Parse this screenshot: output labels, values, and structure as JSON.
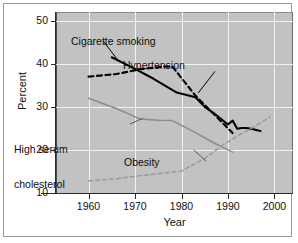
{
  "chart_data": {
    "type": "line",
    "title": "",
    "xlabel": "Year",
    "ylabel": "Percent",
    "xlim": [
      1953,
      2004
    ],
    "ylim": [
      10,
      52
    ],
    "xticks": [
      "1960",
      "1970",
      "1980",
      "1990",
      "2000"
    ],
    "xtick_values": [
      1960,
      1970,
      1980,
      1990,
      2000
    ],
    "yticks": [
      "10",
      "20",
      "30",
      "40",
      "50"
    ],
    "ytick_values": [
      10,
      20,
      30,
      40,
      50
    ],
    "grid": "white gridlines at ticks",
    "legend_position": "inline annotations with leader lines",
    "plot_background": "#c2c2c2",
    "series": [
      {
        "name": "Cigarette smoking",
        "color": "#000000",
        "style": "solid",
        "label_position": {
          "x": 1963.5,
          "y": 46.5
        },
        "x": [
          1965,
          1970,
          1974,
          1979,
          1983,
          1985,
          1987,
          1990,
          1991,
          1992,
          1993,
          1994,
          1995,
          1997
        ],
        "values": [
          41.5,
          38.8,
          36.5,
          33.3,
          32.2,
          30.0,
          28.5,
          25.9,
          26.8,
          24.9,
          25.1,
          25.1,
          24.9,
          24.4
        ]
      },
      {
        "name": "Hypertension",
        "color": "#000000",
        "style": "dashed",
        "label_position": {
          "x": 1988,
          "y": 39.2
        },
        "x": [
          1960,
          1966,
          1971,
          1976,
          1978,
          1983,
          1987,
          1991
        ],
        "values": [
          37.0,
          37.6,
          38.7,
          39.3,
          39.4,
          32.6,
          28.3,
          23.9
        ]
      },
      {
        "name": "High serum cholesterol",
        "color": "#8c8c8c",
        "style": "solid",
        "label_position": {
          "x": 1957,
          "y": 24.7
        },
        "x": [
          1960,
          1966,
          1971,
          1975,
          1978,
          1983,
          1987,
          1991
        ],
        "values": [
          32.0,
          29.6,
          27.2,
          26.9,
          26.8,
          24.0,
          21.6,
          19.5
        ]
      },
      {
        "name": "Obesity",
        "color": "#9a9a9a",
        "style": "dashed",
        "label_position": {
          "x": 1985.5,
          "y": 16.5
        },
        "x": [
          1960,
          1966,
          1971,
          1976,
          1980,
          1985,
          1989,
          1993,
          1996,
          1999
        ],
        "values": [
          12.8,
          13.3,
          14.0,
          14.6,
          15.1,
          18.0,
          21.2,
          23.8,
          25.6,
          27.6
        ]
      }
    ],
    "annotations": [
      {
        "name": "cigarette-smoking-label",
        "text": "Cigarette smoking",
        "leader": "from label down-left to solid black line"
      },
      {
        "name": "hypertension-label",
        "text": "Hypertension",
        "leader": "from label down-left to dashed black line"
      },
      {
        "name": "high-serum-cholesterol-label",
        "text": "High serum\ncholesterol",
        "line1": "High serum",
        "line2": "cholesterol",
        "leader": "from label up-right to gray solid line"
      },
      {
        "name": "obesity-label",
        "text": "Obesity",
        "leader": "from label up-left to gray dashed line"
      }
    ]
  },
  "axes": {
    "ylabel": "Percent",
    "xlabel": "Year",
    "yticks": [
      "50",
      "40",
      "30",
      "20",
      "10"
    ],
    "xticks": [
      "1960",
      "1970",
      "1980",
      "1990",
      "2000"
    ]
  },
  "labels": {
    "cigarette_smoking": "Cigarette smoking",
    "hypertension": "Hypertension",
    "cholesterol_line1": "High serum",
    "cholesterol_line2": "cholesterol",
    "obesity": "Obesity"
  },
  "colors": {
    "plot_bg": "#c2c2c2",
    "grid": "#f2f2f2",
    "black_series": "#000000",
    "gray_series": "#8c8c8c",
    "frame": "#9a9a9a"
  }
}
